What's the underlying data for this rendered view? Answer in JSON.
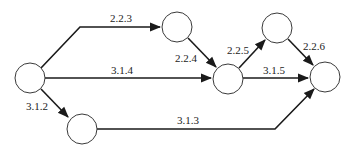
{
  "diagram": {
    "type": "activity-network",
    "colors": {
      "stroke": "#1a1a1a",
      "node_fill": "#ffffff",
      "text": "#222222"
    },
    "nodes": [
      {
        "id": "n1",
        "cx": 30,
        "cy": 78,
        "r": 15
      },
      {
        "id": "n2",
        "cx": 177,
        "cy": 27,
        "r": 15
      },
      {
        "id": "n3",
        "cx": 228,
        "cy": 79,
        "r": 15
      },
      {
        "id": "n4",
        "cx": 277,
        "cy": 28,
        "r": 15
      },
      {
        "id": "n5",
        "cx": 325,
        "cy": 77,
        "r": 15
      },
      {
        "id": "n6",
        "cx": 82,
        "cy": 129,
        "r": 15
      }
    ],
    "edges": [
      {
        "id": "e-2-2-3",
        "label": "2.2.3",
        "from": "n1",
        "to": "n2",
        "label_x": 100,
        "label_y": 23
      },
      {
        "id": "e-3-1-4",
        "label": "3.1.4",
        "from": "n1",
        "to": "n3",
        "label_x": 106,
        "label_y": 74
      },
      {
        "id": "e-3-1-2",
        "label": "3.1.2",
        "from": "n1",
        "to": "n6",
        "label_x": 26,
        "label_y": 109
      },
      {
        "id": "e-2-2-4",
        "label": "2.2.4",
        "from": "n2",
        "to": "n3",
        "label_x": 175,
        "label_y": 61
      },
      {
        "id": "e-2-2-5",
        "label": "2.2.5",
        "from": "n3",
        "to": "n4",
        "label_x": 227,
        "label_y": 53
      },
      {
        "id": "e-3-1-5",
        "label": "3.1.5",
        "from": "n3",
        "to": "n5",
        "label_x": 263,
        "label_y": 74
      },
      {
        "id": "e-2-2-6",
        "label": "2.2.6",
        "from": "n4",
        "to": "n5",
        "label_x": 303,
        "label_y": 49
      },
      {
        "id": "e-3-1-3",
        "label": "3.1.3",
        "from": "n6",
        "to": "n5",
        "label_x": 177,
        "label_y": 124
      }
    ]
  }
}
